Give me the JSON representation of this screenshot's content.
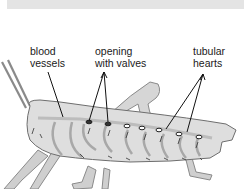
{
  "figure": {
    "labels": {
      "blood_vessels": "blood\nvessels",
      "opening_with_valves": "opening\nwith valves",
      "tubular_hearts": "tubular\nhearts"
    }
  },
  "colors": {
    "top_band": "#e4e4e4",
    "body_fill": "#dcdcdc",
    "outline": "#6b6b6b",
    "leader_line": "#111111"
  }
}
